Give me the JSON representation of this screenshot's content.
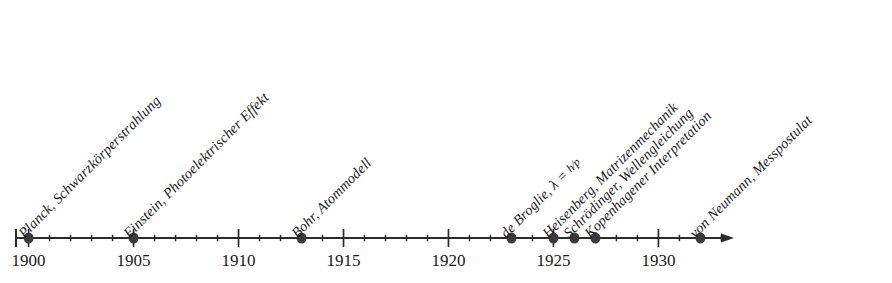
{
  "figure": {
    "kind": "timeline",
    "title": "",
    "axis": {
      "start_year": 1899.4,
      "end_year": 1933.6,
      "arrow": true,
      "major_tick_step": 5,
      "minor_tick_step": 1,
      "baseline_color": "#2b2b2b",
      "marker_color": "#3a3a3a"
    },
    "year_labels": [
      {
        "year": 1900,
        "text": "1900"
      },
      {
        "year": 1905,
        "text": "1905"
      },
      {
        "year": 1910,
        "text": "1910"
      },
      {
        "year": 1915,
        "text": "1915"
      },
      {
        "year": 1920,
        "text": "1920"
      },
      {
        "year": 1925,
        "text": "1925"
      },
      {
        "year": 1930,
        "text": "1930"
      }
    ],
    "events": [
      {
        "year": 1900,
        "label": "Planck, Schwarzkörperstrahlung",
        "formula": ""
      },
      {
        "year": 1905,
        "label": "Einstein, Photoelektrischer Effekt",
        "formula": ""
      },
      {
        "year": 1913,
        "label": "Bohr, Atommodell",
        "formula": ""
      },
      {
        "year": 1923,
        "label": "de Broglie, ",
        "formula": "λ = h/p"
      },
      {
        "year": 1925,
        "label": "Heisenberg, Matrizenmechanik",
        "formula": ""
      },
      {
        "year": 1926,
        "label": "Schrödinger, Wellengleichung",
        "formula": ""
      },
      {
        "year": 1927,
        "label": "Kopenhagener Interpretation",
        "formula": ""
      },
      {
        "year": 1932,
        "label": "von Neumann, Messpostulat",
        "formula": ""
      }
    ]
  },
  "chart_data": {
    "type": "timeline",
    "xlabel": "",
    "ylabel": "",
    "xlim": [
      1899.4,
      1933.6
    ],
    "grid": false,
    "legend": "none",
    "categories": [
      1900,
      1905,
      1913,
      1923,
      1925,
      1926,
      1927,
      1932
    ],
    "values": [
      "Planck, Schwarzkörperstrahlung",
      "Einstein, Photoelektrischer Effekt",
      "Bohr, Atommodell",
      "de Broglie, λ = h/p",
      "Heisenberg, Matrizenmechanik",
      "Schrödinger, Wellengleichung",
      "Kopenhagener Interpretation",
      "von Neumann, Messpostulat"
    ],
    "tick_labels": [
      "1900",
      "1905",
      "1910",
      "1915",
      "1920",
      "1925",
      "1930"
    ],
    "major_ticks": [
      1900,
      1905,
      1910,
      1915,
      1920,
      1925,
      1930
    ],
    "minor_tick_step": 1
  }
}
